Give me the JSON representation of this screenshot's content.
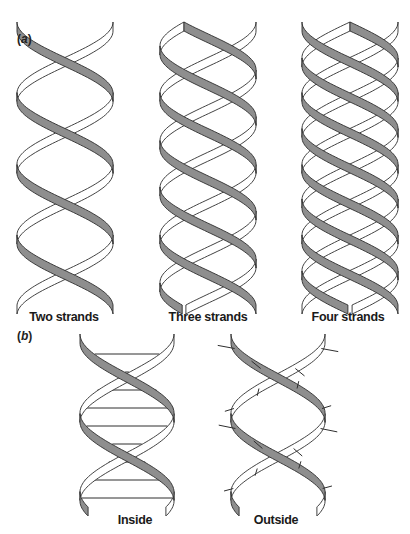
{
  "figure": {
    "panel_a": {
      "label_open": "(",
      "label_letter": "a",
      "label_close": ")",
      "helices": [
        {
          "caption": "Two strands",
          "strands": 2,
          "cx": 65,
          "half_width": 48,
          "y_top": 22,
          "y_bot": 305,
          "pitch": 142,
          "phase": 0.0
        },
        {
          "caption": "Three strands",
          "strands": 3,
          "cx": 208,
          "half_width": 48,
          "y_top": 22,
          "y_bot": 305,
          "pitch": 142,
          "phase": 0.0
        },
        {
          "caption": "Four strands",
          "strands": 4,
          "cx": 350,
          "half_width": 48,
          "y_top": 22,
          "y_bot": 305,
          "pitch": 142,
          "phase": 0.0
        }
      ]
    },
    "panel_b": {
      "label_open": "(",
      "label_letter": "b",
      "label_close": ")",
      "helices": [
        {
          "caption": "Inside",
          "strands": 2,
          "cx": 127,
          "half_width": 47,
          "y_top": 334,
          "y_bot": 507,
          "pitch": 158,
          "phase": 0.0,
          "bases": "inside"
        },
        {
          "caption": "Outside",
          "strands": 2,
          "cx": 278,
          "half_width": 47,
          "y_top": 334,
          "y_bot": 507,
          "pitch": 158,
          "phase": 0.0,
          "bases": "outside"
        }
      ]
    },
    "colors": {
      "ribbon_fill": "#8e8e8e",
      "ribbon_back_fill": "#ffffff",
      "outline": "#2e2e2e",
      "background": "#ffffff"
    }
  }
}
